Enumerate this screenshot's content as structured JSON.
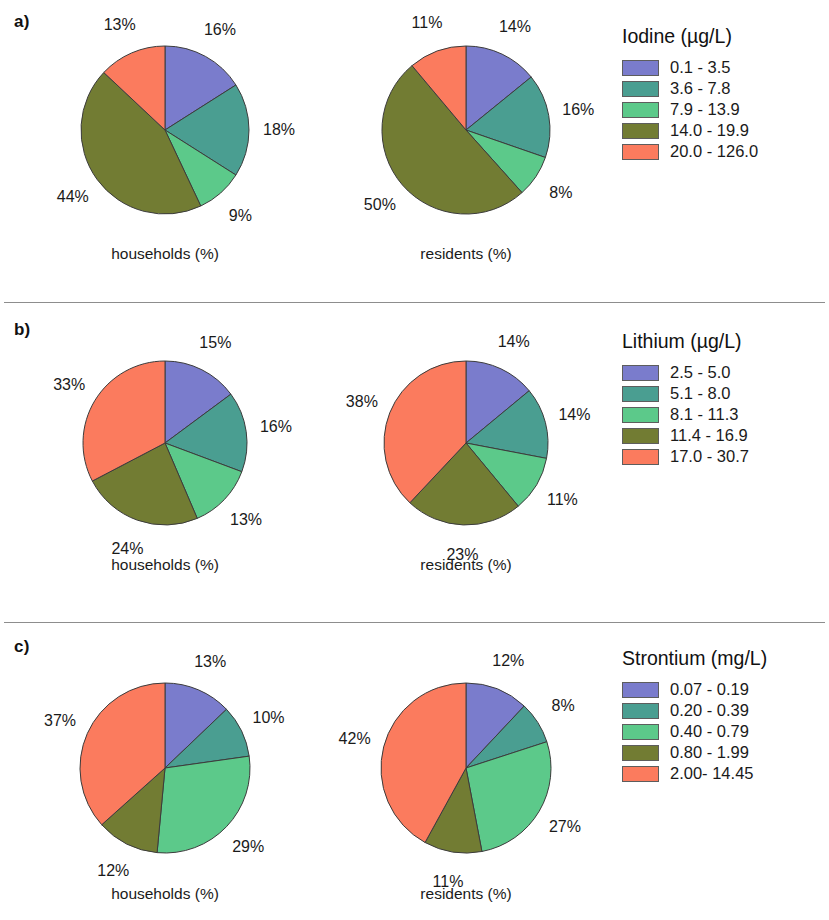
{
  "figure": {
    "background": "#ffffff",
    "palette": [
      "#7a7ccc",
      "#4a9e91",
      "#5cc98a",
      "#727c33",
      "#fb7b5e"
    ],
    "slice_border": "#3c3c3c"
  },
  "panels": [
    {
      "letter": "a)",
      "legend": {
        "title": "Iodine (µg/L)",
        "items": [
          {
            "label": "0.1 - 3.5",
            "color": "#7a7ccc"
          },
          {
            "label": "3.6 - 7.8",
            "color": "#4a9e91"
          },
          {
            "label": "7.9 - 13.9",
            "color": "#5cc98a"
          },
          {
            "label": "14.0 - 19.9",
            "color": "#727c33"
          },
          {
            "label": "20.0 - 126.0",
            "color": "#fb7b5e"
          }
        ]
      },
      "charts": [
        {
          "caption": "households (%)",
          "labels": [
            "16%",
            "18%",
            "9%",
            "44%",
            "13%"
          ]
        },
        {
          "caption": "residents (%)",
          "labels": [
            "14%",
            "16%",
            "8%",
            "50%",
            "11%"
          ]
        }
      ]
    },
    {
      "letter": "b)",
      "legend": {
        "title": "Lithium (µg/L)",
        "items": [
          {
            "label": "2.5 - 5.0",
            "color": "#7a7ccc"
          },
          {
            "label": "5.1 - 8.0",
            "color": "#4a9e91"
          },
          {
            "label": "8.1 - 11.3",
            "color": "#5cc98a"
          },
          {
            "label": "11.4 - 16.9",
            "color": "#727c33"
          },
          {
            "label": "17.0 - 30.7",
            "color": "#fb7b5e"
          }
        ]
      },
      "charts": [
        {
          "caption": "households (%)",
          "labels": [
            "15%",
            "16%",
            "13%",
            "24%",
            "33%"
          ]
        },
        {
          "caption": "residents (%)",
          "labels": [
            "14%",
            "14%",
            "11%",
            "23%",
            "38%"
          ]
        }
      ]
    },
    {
      "letter": "c)",
      "legend": {
        "title": "Strontium (mg/L)",
        "items": [
          {
            "label": "0.07 - 0.19",
            "color": "#7a7ccc"
          },
          {
            "label": "0.20 - 0.39",
            "color": "#4a9e91"
          },
          {
            "label": "0.40 - 0.79",
            "color": "#5cc98a"
          },
          {
            "label": "0.80 - 1.99",
            "color": "#727c33"
          },
          {
            "label": "2.00- 14.45",
            "color": "#fb7b5e"
          }
        ]
      },
      "charts": [
        {
          "caption": "households (%)",
          "labels": [
            "13%",
            "10%",
            "29%",
            "12%",
            "37%"
          ]
        },
        {
          "caption": "residents (%)",
          "labels": [
            "12%",
            "8%",
            "27%",
            "11%",
            "42%"
          ]
        }
      ]
    }
  ],
  "chart_data": {
    "type": "pie",
    "start_angle_deg": 0,
    "direction": "clockwise",
    "legend_position": "right",
    "panels": [
      {
        "letter": "a)",
        "element": "Iodine",
        "unit": "µg/L",
        "categories": [
          "0.1 - 3.5",
          "3.6 - 7.8",
          "7.9 - 13.9",
          "14.0 - 19.9",
          "20.0 - 126.0"
        ],
        "colors": [
          "#7a7ccc",
          "#4a9e91",
          "#5cc98a",
          "#727c33",
          "#fb7b5e"
        ],
        "series": [
          {
            "name": "households (%)",
            "values": [
              16,
              18,
              9,
              44,
              13
            ]
          },
          {
            "name": "residents (%)",
            "values": [
              14,
              16,
              8,
              50,
              11
            ]
          }
        ]
      },
      {
        "letter": "b)",
        "element": "Lithium",
        "unit": "µg/L",
        "categories": [
          "2.5 - 5.0",
          "5.1 - 8.0",
          "8.1 - 11.3",
          "11.4 - 16.9",
          "17.0 - 30.7"
        ],
        "colors": [
          "#7a7ccc",
          "#4a9e91",
          "#5cc98a",
          "#727c33",
          "#fb7b5e"
        ],
        "series": [
          {
            "name": "households (%)",
            "values": [
              15,
              16,
              13,
              24,
              33
            ]
          },
          {
            "name": "residents (%)",
            "values": [
              14,
              14,
              11,
              23,
              38
            ]
          }
        ]
      },
      {
        "letter": "c)",
        "element": "Strontium",
        "unit": "mg/L",
        "categories": [
          "0.07 - 0.19",
          "0.20 - 0.39",
          "0.40 - 0.79",
          "0.80 - 1.99",
          "2.00- 14.45"
        ],
        "colors": [
          "#7a7ccc",
          "#4a9e91",
          "#5cc98a",
          "#727c33",
          "#fb7b5e"
        ],
        "series": [
          {
            "name": "households (%)",
            "values": [
              13,
              10,
              29,
              12,
              37
            ]
          },
          {
            "name": "residents (%)",
            "values": [
              12,
              8,
              27,
              11,
              42
            ]
          }
        ]
      }
    ]
  }
}
